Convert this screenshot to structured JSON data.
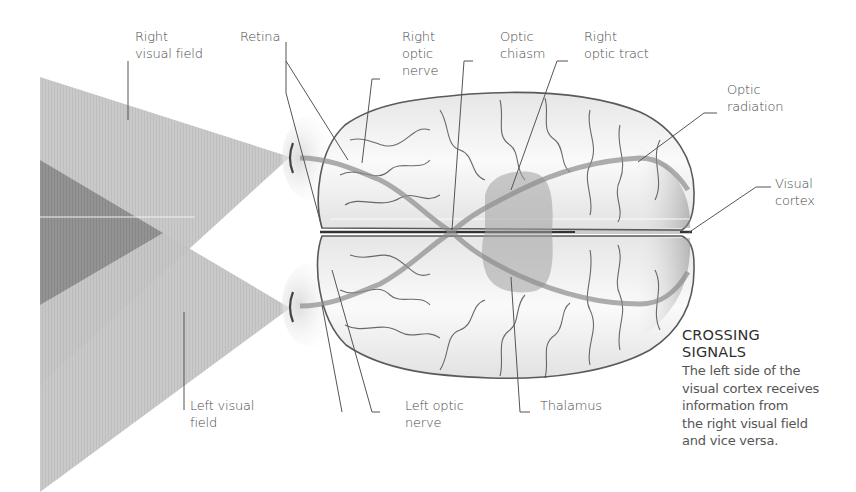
{
  "diagram": {
    "type": "anatomical-illustration",
    "colors": {
      "background": "#ffffff",
      "field_light": "#c4c4c4",
      "field_overlap": "#8f8f8f",
      "brain_fill": "#f2f2f2",
      "brain_outline": "#5a5a5a",
      "pathway": "#9a9a9a",
      "thalamus": "#a8a8a8",
      "leader_line": "#555555",
      "text": "#4a4a4a"
    }
  },
  "labels": {
    "right_visual_field": [
      "Right",
      "visual field"
    ],
    "retina": [
      "Retina"
    ],
    "right_optic_nerve": [
      "Right",
      "optic",
      "nerve"
    ],
    "optic_chiasm": [
      "Optic",
      "chiasm"
    ],
    "right_optic_tract": [
      "Right",
      "optic tract"
    ],
    "optic_radiation": [
      "Optic",
      "radiation"
    ],
    "visual_cortex": [
      "Visual",
      "cortex"
    ],
    "left_visual_field": [
      "Left visual",
      "field"
    ],
    "left_optic_nerve": [
      "Left optic",
      "nerve"
    ],
    "thalamus": [
      "Thalamus"
    ]
  },
  "callout": {
    "title": [
      "CROSSING",
      "SIGNALS"
    ],
    "body": [
      "The left side of the",
      "visual cortex receives",
      "information from",
      "the right visual field",
      "and vice versa."
    ]
  }
}
